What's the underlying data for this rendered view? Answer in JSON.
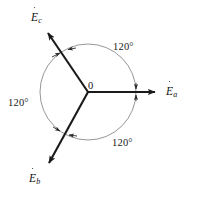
{
  "figure": {
    "background_color": "#ffffff",
    "vector_color": "#1a1a1a",
    "circle_color": "#8a8a8a",
    "text_color": "#111111"
  },
  "origin": {
    "label": "0",
    "x": 88,
    "y": 92
  },
  "circle": {
    "center_x": 88,
    "center_y": 92,
    "radius": 48
  },
  "vectors": [
    {
      "id": "Ea",
      "label_base": "E",
      "label_sub": "a",
      "has_overdot": true,
      "angle_deg": 0,
      "tip_x": 160,
      "tip_y": 92,
      "label_x": 166,
      "label_y": 85
    },
    {
      "id": "Eb",
      "label_base": "E",
      "label_sub": "b",
      "has_overdot": true,
      "angle_deg": 240,
      "tip_x": 45,
      "tip_y": 168,
      "label_x": 29,
      "label_y": 172
    },
    {
      "id": "Ec",
      "label_base": "E",
      "label_sub": "c",
      "has_overdot": true,
      "angle_deg": 120,
      "tip_x": 44,
      "tip_y": 29,
      "label_x": 31,
      "label_y": 11
    }
  ],
  "angle_labels": [
    {
      "id": "angle-top-right",
      "text": "120°",
      "x": 113,
      "y": 41
    },
    {
      "id": "angle-left",
      "text": "120°",
      "x": 8,
      "y": 97
    },
    {
      "id": "angle-bottom-right",
      "text": "120°",
      "x": 112,
      "y": 137
    }
  ]
}
